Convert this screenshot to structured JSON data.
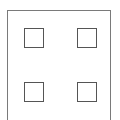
{
  "diagram": {
    "outer_frame": {
      "x": 7,
      "y": 10,
      "w": 105,
      "h": 112,
      "stroke": "#7a7a7a"
    },
    "squares": [
      {
        "name": "top-left",
        "x": 24,
        "y": 28
      },
      {
        "name": "top-right",
        "x": 77,
        "y": 28
      },
      {
        "name": "bottom-left",
        "x": 24,
        "y": 82
      },
      {
        "name": "bottom-right",
        "x": 77,
        "y": 82
      }
    ],
    "square_size": 20,
    "square_stroke": "#555555"
  }
}
